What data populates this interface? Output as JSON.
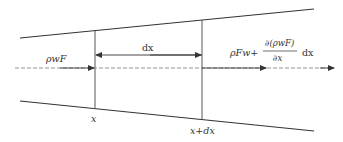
{
  "diagram": {
    "type": "control-volume flow diagram (diverging channel)",
    "colors": {
      "line": "#333333",
      "centerline": "#888888",
      "background": "#ffffff"
    },
    "labels": {
      "inflow": "ρwF",
      "dx_span": "dx",
      "outflow_prefix": "ρFw+",
      "outflow_numerator": "∂(ρwF)",
      "outflow_denominator": "∂x",
      "outflow_suffix": "dx",
      "section_left": "x",
      "section_right": "x+dx"
    }
  }
}
